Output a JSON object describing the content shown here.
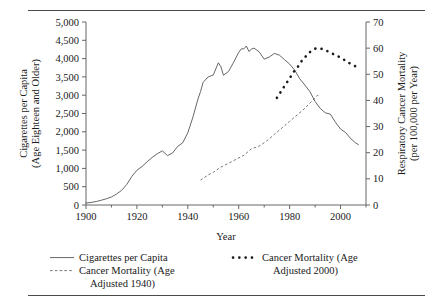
{
  "chart_data": {
    "type": "line",
    "title": "",
    "xlabel": "Year",
    "ylabel": "Cigarettes per Capita (Age Eighteen and Older)",
    "ylabel_line1": "Cigarettes per Capita",
    "ylabel_line2": "(Age Eighteen and Older)",
    "y2label": "Respiratory Cancer Mortality (per 100,000 per Year)",
    "y2label_line1": "Respiratory Cancer Mortality",
    "y2label_line2": "(per 100,000 per Year)",
    "xlim": [
      1900,
      2010
    ],
    "ylim": [
      0,
      5000
    ],
    "y2lim": [
      0,
      70
    ],
    "xticks": [
      1900,
      1920,
      1940,
      1960,
      1980,
      2000
    ],
    "xtick_labels": [
      "1900",
      "1920",
      "1940",
      "1960",
      "1980",
      "2000"
    ],
    "xminorticks": [
      1910,
      1930,
      1950,
      1970,
      1990,
      2010
    ],
    "yticks": [
      0,
      500,
      1000,
      1500,
      2000,
      2500,
      3000,
      3500,
      4000,
      4500,
      5000
    ],
    "ytick_labels": [
      "0",
      "500",
      "1,000",
      "1,500",
      "2,000",
      "2,500",
      "3,000",
      "3,500",
      "4,000",
      "4,500",
      "5,000"
    ],
    "y2ticks": [
      0,
      10,
      20,
      30,
      40,
      50,
      60,
      70
    ],
    "y2tick_labels": [
      "0",
      "10",
      "20",
      "30",
      "40",
      "50",
      "60",
      "70"
    ],
    "grid": false,
    "legend_position": "below",
    "series": [
      {
        "name": "Cigarettes per Capita",
        "style": "solid",
        "axis": "left",
        "color": "#555555",
        "x": [
          1900,
          1902,
          1904,
          1906,
          1908,
          1910,
          1912,
          1914,
          1916,
          1918,
          1920,
          1922,
          1924,
          1926,
          1928,
          1930,
          1932,
          1934,
          1936,
          1938,
          1940,
          1942,
          1944,
          1945,
          1946,
          1948,
          1950,
          1952,
          1953,
          1954,
          1955,
          1956,
          1958,
          1960,
          1961,
          1962,
          1963,
          1964,
          1965,
          1966,
          1968,
          1970,
          1972,
          1974,
          1976,
          1978,
          1980,
          1982,
          1984,
          1986,
          1988,
          1990,
          1992,
          1994,
          1996,
          1998,
          2000,
          2002,
          2004,
          2006,
          2007
        ],
        "y": [
          54,
          70,
          95,
          130,
          170,
          220,
          300,
          400,
          560,
          780,
          950,
          1050,
          1180,
          1300,
          1400,
          1480,
          1350,
          1420,
          1600,
          1700,
          1976,
          2400,
          2900,
          3100,
          3350,
          3500,
          3552,
          3886,
          3778,
          3546,
          3597,
          3650,
          3900,
          4171,
          4266,
          4266,
          4345,
          4194,
          4258,
          4287,
          4186,
          3985,
          4043,
          4141,
          4092,
          3970,
          3851,
          3684,
          3446,
          3274,
          3096,
          2827,
          2640,
          2520,
          2482,
          2261,
          2076,
          1979,
          1814,
          1691,
          1650
        ]
      },
      {
        "name": "Cancer Mortality (Age Adjusted 1940)",
        "style": "dashed",
        "axis": "right",
        "color": "#666666",
        "x": [
          1945,
          1948,
          1950,
          1953,
          1956,
          1959,
          1962,
          1965,
          1968,
          1971,
          1974,
          1977,
          1980,
          1983,
          1986,
          1989,
          1991,
          1992
        ],
        "y": [
          9.5,
          11.5,
          12.5,
          14.5,
          16.0,
          17.5,
          19.0,
          21.5,
          22.5,
          24.5,
          27.0,
          29.5,
          32.0,
          34.5,
          37.0,
          40.0,
          42.0,
          41.8
        ]
      },
      {
        "name": "Cancer Mortality (Age Adjusted 2000)",
        "style": "dotted",
        "axis": "right",
        "color": "#1a1a1a",
        "x": [
          1975,
          1976,
          1977,
          1978,
          1979,
          1980,
          1981,
          1982,
          1983,
          1984,
          1985,
          1986,
          1987,
          1988,
          1989,
          1990,
          1991,
          1992,
          1993,
          1994,
          1995,
          1996,
          1997,
          1998,
          1999,
          2000,
          2001,
          2002,
          2003,
          2004,
          2005,
          2006,
          2007
        ],
        "y": [
          41.0,
          42.5,
          44.0,
          45.5,
          47.0,
          48.5,
          50.0,
          51.5,
          52.5,
          54.0,
          55.5,
          56.5,
          57.5,
          58.5,
          59.2,
          59.8,
          60.0,
          59.9,
          59.6,
          59.2,
          58.8,
          58.3,
          57.8,
          57.4,
          56.9,
          56.4,
          55.8,
          55.2,
          54.5,
          54.0,
          53.5,
          53.0,
          52.4
        ]
      }
    ]
  },
  "legend": {
    "entries": [
      {
        "label": "Cigarettes per Capita",
        "label2": "",
        "style": "solid"
      },
      {
        "label": "Cancer Mortality (Age",
        "label2": "Adjusted 1940)",
        "style": "dashed"
      },
      {
        "label": "Cancer Mortality (Age",
        "label2": "Adjusted 2000)",
        "style": "dotted"
      }
    ]
  }
}
